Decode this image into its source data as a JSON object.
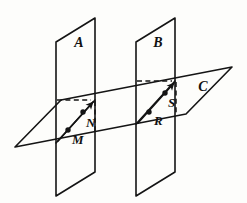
{
  "figure": {
    "canvas": {
      "width": 247,
      "height": 203,
      "background": "#fdfdfb"
    },
    "stroke_color": "#141414",
    "planes": [
      {
        "id": "A",
        "label": "A",
        "label_x": 79,
        "label_y": 46,
        "orientation": "vertical",
        "points": "95,18 95,172 56,196 56,42"
      },
      {
        "id": "B",
        "label": "B",
        "label_x": 158,
        "label_y": 46,
        "orientation": "vertical",
        "points": "175,18 175,172 136,196 136,42"
      },
      {
        "id": "C",
        "label": "C",
        "label_x": 203,
        "label_y": 90,
        "orientation": "horizontal",
        "points": "232,67 186,114 15,147 61,100"
      }
    ],
    "points": [
      {
        "id": "M",
        "label": "M",
        "x": 68,
        "y": 130,
        "label_x": 72,
        "label_y": 143
      },
      {
        "id": "N",
        "label": "N",
        "x": 83,
        "y": 111,
        "label_x": 86,
        "label_y": 126
      },
      {
        "id": "R",
        "label": "R",
        "x": 149,
        "y": 112,
        "label_x": 154,
        "label_y": 124
      },
      {
        "id": "S",
        "label": "S",
        "x": 165,
        "y": 92,
        "label_x": 168,
        "label_y": 106
      }
    ],
    "rays": [
      {
        "id": "ray-MN",
        "from": "M",
        "to": "N",
        "x1": 58,
        "y1": 141,
        "x2": 95,
        "y2": 100,
        "arrow": "end"
      },
      {
        "id": "ray-RS",
        "from": "R",
        "to": "S",
        "x1": 138,
        "y1": 123,
        "x2": 176,
        "y2": 80,
        "arrow": "end"
      }
    ],
    "hidden_lines": [
      {
        "id": "hidden-top-A",
        "x1": 57,
        "y1": 100,
        "x2": 93,
        "y2": 100
      },
      {
        "id": "hidden-vert-A",
        "x1": 95,
        "y1": 101,
        "x2": 95,
        "y2": 133
      },
      {
        "id": "hidden-top-B",
        "x1": 137,
        "y1": 81,
        "x2": 174,
        "y2": 81
      },
      {
        "id": "hidden-vert-B",
        "x1": 176,
        "y1": 82,
        "x2": 176,
        "y2": 114
      }
    ],
    "intersection_lines": [
      {
        "id": "intersect-A-C",
        "x1": 56,
        "y1": 143,
        "x2": 95,
        "y2": 100
      },
      {
        "id": "intersect-B-C",
        "x1": 136,
        "y1": 124,
        "x2": 175,
        "y2": 81
      }
    ]
  }
}
